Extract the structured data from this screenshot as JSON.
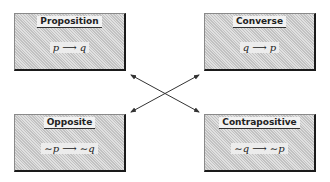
{
  "diagram": {
    "boxes": [
      {
        "id": "proposition",
        "title": "Proposition",
        "formula": "p ⟶ q"
      },
      {
        "id": "converse",
        "title": "Converse",
        "formula": "q ⟶ p"
      },
      {
        "id": "opposite",
        "title": "Opposite",
        "formula": "∼p ⟶ ∼q"
      },
      {
        "id": "contrapositive",
        "title": "Contrapositive",
        "formula": "∼q ⟶ ∼p"
      }
    ],
    "connections": [
      {
        "from": "proposition",
        "to": "contrapositive",
        "type": "double-arrow"
      },
      {
        "from": "converse",
        "to": "opposite",
        "type": "double-arrow"
      }
    ],
    "colors": {
      "box_fill": "#d4d4d4",
      "shadow": "#1a1a1a",
      "line": "#333333"
    }
  }
}
